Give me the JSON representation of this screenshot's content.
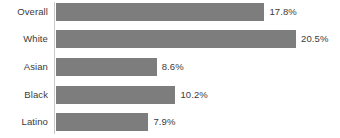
{
  "chart_data": {
    "type": "bar",
    "orientation": "horizontal",
    "title": "",
    "subtitle": "",
    "xlabel": "",
    "ylabel": "",
    "grid": false,
    "legend": false,
    "axis_line": true,
    "xlim": [
      0,
      20.5
    ],
    "categories": [
      "Overall",
      "White",
      "Asian",
      "Black",
      "Latino"
    ],
    "values": [
      17.8,
      20.5,
      8.6,
      10.2,
      7.9
    ],
    "value_labels": [
      "17.8%",
      "20.5%",
      "8.6%",
      "10.2%",
      "7.9%"
    ],
    "tick_labels": [],
    "annotations": [],
    "bar_color": "#7d7d7d",
    "text_color": "#3b3b3b",
    "background_color": "#ffffff",
    "axis_color": "#c9c9c9"
  }
}
